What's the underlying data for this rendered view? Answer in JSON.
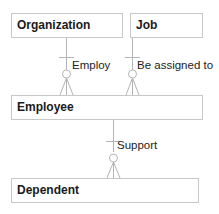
{
  "diagram": {
    "type": "entity-relationship",
    "entities": [
      {
        "id": "organization",
        "label": "Organization"
      },
      {
        "id": "job",
        "label": "Job"
      },
      {
        "id": "employee",
        "label": "Employee"
      },
      {
        "id": "dependent",
        "label": "Dependent"
      }
    ],
    "relationships": [
      {
        "label": "Employ",
        "from": "organization",
        "to": "employee",
        "from_cardinality": "one",
        "to_cardinality": "zero-or-many"
      },
      {
        "label": "Be assigned to",
        "from": "job",
        "to": "employee",
        "from_cardinality": "one",
        "to_cardinality": "zero-or-many"
      },
      {
        "label": "Support",
        "from": "employee",
        "to": "dependent",
        "from_cardinality": "one",
        "to_cardinality": "zero-or-many"
      }
    ]
  }
}
